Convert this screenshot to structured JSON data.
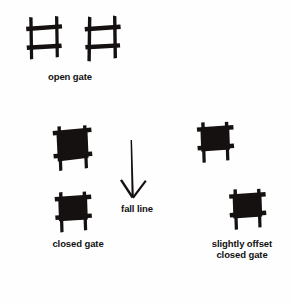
{
  "figure": {
    "background_color": "#fefefe",
    "ink_color": "#141110"
  },
  "labels": {
    "open_gate": "open gate",
    "closed_gate": "closed gate",
    "fall_line": "fall line",
    "offset_closed_gate": "slightly offset\nclosed gate"
  },
  "symbols": [
    {
      "id": "open-gate-1",
      "kind": "open-gate",
      "description": "two vertical poles crossed by two horizontal gate bars, hash shape",
      "x": 26,
      "y": 16,
      "width": 36,
      "height": 45
    },
    {
      "id": "open-gate-2",
      "kind": "open-gate",
      "description": "two vertical poles crossed by two horizontal gate bars, hash shape",
      "x": 84,
      "y": 16,
      "width": 36,
      "height": 47
    },
    {
      "id": "closed-gate-1",
      "kind": "closed-gate",
      "description": "filled black gate panel with poles extending past the corners",
      "x": 52,
      "y": 126,
      "width": 40,
      "height": 45
    },
    {
      "id": "closed-gate-2",
      "kind": "closed-gate",
      "description": "filled black gate panel with poles extending past the corners",
      "x": 54,
      "y": 192,
      "width": 38,
      "height": 42
    },
    {
      "id": "offset-closed-gate-1",
      "kind": "offset-closed-gate",
      "description": "filled black gate panel shifted across the fall line",
      "x": 196,
      "y": 122,
      "width": 38,
      "height": 42
    },
    {
      "id": "offset-closed-gate-2",
      "kind": "offset-closed-gate",
      "description": "filled black gate panel shifted across the fall line",
      "x": 228,
      "y": 189,
      "width": 38,
      "height": 42
    }
  ],
  "arrow": {
    "id": "fall-line-arrow",
    "kind": "down-arrow",
    "description": "thin tapered vertical shaft with open V arrowhead pointing down",
    "top_x": 131,
    "top_y": 140,
    "bottom_x": 133,
    "bottom_y": 198
  },
  "colors": {
    "ink": "#141110",
    "paper": "#fefefe"
  }
}
